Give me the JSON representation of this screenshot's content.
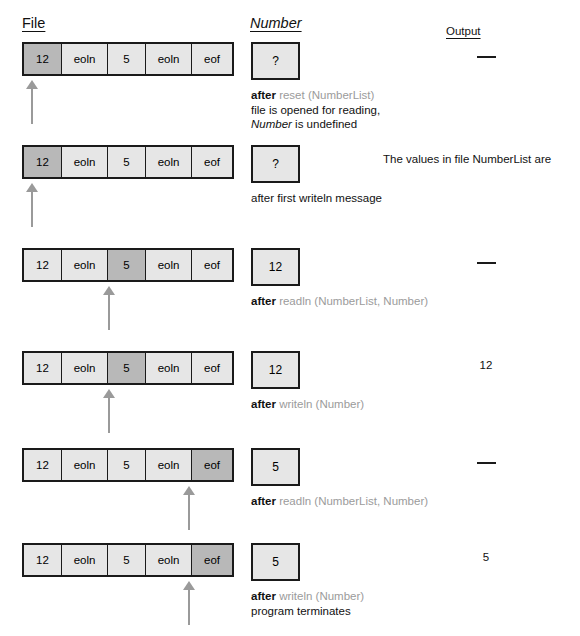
{
  "headings": {
    "file": "File",
    "number": "Number",
    "output": "Output"
  },
  "file_cells": [
    {
      "label": "12",
      "width_class": "w-num"
    },
    {
      "label": "eoln",
      "width_class": "w-eoln"
    },
    {
      "label": "5",
      "width_class": "w-5"
    },
    {
      "label": "eoln",
      "width_class": "w-eoln"
    },
    {
      "label": "eof",
      "width_class": "w-eof"
    }
  ],
  "colors": {
    "cell_bg": "#e6e6e6",
    "cell_highlight": "#b8b8b8",
    "border": "#1a1a1a",
    "code_gray": "#9b9b9b",
    "arrow_gray": "#9a9a9a"
  },
  "rows": [
    {
      "id": "row-1",
      "top": 42,
      "highlight_index": 0,
      "arrow_left": 26,
      "number_value": "?",
      "caption": [
        {
          "kw": "after",
          "code": "reset (NumberList)"
        },
        {
          "plain": "file is opened for reading,"
        },
        {
          "italic_head": "Number",
          "plain_tail": " is undefined"
        }
      ],
      "output": {
        "type": "dash",
        "text": "—"
      }
    },
    {
      "id": "row-2",
      "top": 145,
      "highlight_index": 0,
      "arrow_left": 26,
      "number_value": "?",
      "caption": [
        {
          "plain": "after first writeln message"
        }
      ],
      "output": {
        "type": "message",
        "text": "The values in file NumberList are"
      }
    },
    {
      "id": "row-3",
      "top": 248,
      "highlight_index": 2,
      "arrow_left": 103,
      "number_value": "12",
      "caption": [
        {
          "kw": "after",
          "code": "readln (NumberList, Number)"
        }
      ],
      "output": {
        "type": "dash",
        "text": "—"
      }
    },
    {
      "id": "row-4",
      "top": 351,
      "highlight_index": 2,
      "arrow_left": 103,
      "number_value": "12",
      "caption": [
        {
          "kw": "after",
          "code": "writeln (Number)"
        }
      ],
      "output": {
        "type": "value",
        "text": "12"
      }
    },
    {
      "id": "row-5",
      "top": 448,
      "highlight_index": 4,
      "arrow_left": 183,
      "number_value": "5",
      "caption": [
        {
          "kw": "after",
          "code": "readln (NumberList, Number)"
        }
      ],
      "output": {
        "type": "dash",
        "text": "—"
      }
    },
    {
      "id": "row-6",
      "top": 543,
      "highlight_index": 4,
      "arrow_left": 183,
      "number_value": "5",
      "caption": [
        {
          "kw": "after",
          "code": "writeln (Number)"
        },
        {
          "plain": "program terminates"
        }
      ],
      "output": {
        "type": "value",
        "text": "5"
      }
    }
  ]
}
